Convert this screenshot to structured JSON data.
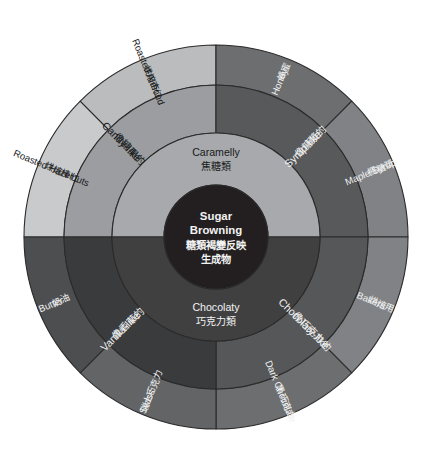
{
  "figure": {
    "background_color": "#ffffff",
    "stroke_color": "#2b2b2b"
  },
  "core": {
    "name": "core-hub",
    "en_line1": "Sugar",
    "en_line2": "Browning",
    "zh_line1": "糖類褐變反映",
    "zh_line2": "生成物",
    "color": "#231f20",
    "text_color": "#f2f3f3"
  },
  "inner_ring": [
    {
      "key": "caramelly",
      "en": "Caramelly",
      "zh": "焦糖類",
      "color": "#a7a9ac",
      "text_color": "#17191a",
      "start_angle": 180,
      "end_angle": 360
    },
    {
      "key": "chocolaty",
      "en": "Chocolaty",
      "zh": "巧克力類",
      "color": "#404041",
      "text_color": "#f2f3f3",
      "start_angle": 0,
      "end_angle": 180
    }
  ],
  "middle_ring": [
    {
      "key": "candy-like",
      "en": "Candy-like",
      "zh": "像糖果的",
      "color": "#9b9da0",
      "text_color": "#17191a",
      "start_angle": 180,
      "end_angle": 270
    },
    {
      "key": "syrup-like",
      "en": "Syrup-like",
      "zh": "像糖漿的",
      "color": "#58595b",
      "text_color": "#f2f3f3",
      "start_angle": 270,
      "end_angle": 360
    },
    {
      "key": "chocolaty-like",
      "en": "Chocolaty-like",
      "zh": "像巧克力的",
      "color": "#565758",
      "text_color": "#f2f3f3",
      "start_angle": 0,
      "end_angle": 90
    },
    {
      "key": "vanilla-like",
      "en": "Vanilla-like",
      "zh": "像香草的",
      "color": "#3a3b3d",
      "text_color": "#f2f3f3",
      "start_angle": 90,
      "end_angle": 180
    }
  ],
  "outer_ring": [
    {
      "key": "roasted-hazelnuts",
      "en": "Roasted Hazelnuts",
      "zh": "烘焙榛仁",
      "color": "#c9cacb",
      "text_color": "#17191a",
      "start_angle": 180,
      "end_angle": 225
    },
    {
      "key": "roasted-almond",
      "en": "Roasted Almond",
      "zh": "烘焙杏仁",
      "color": "#babcbd",
      "text_color": "#17191a",
      "start_angle": 225,
      "end_angle": 270
    },
    {
      "key": "honey",
      "en": "Honey",
      "zh": "蜂蜜",
      "color": "#6d6e70",
      "text_color": "#f2f3f3",
      "start_angle": 270,
      "end_angle": 315
    },
    {
      "key": "maple-syrup",
      "en": "Maple Syrup",
      "zh": "楓糖漿",
      "color": "#808285",
      "text_color": "#f2f3f3",
      "start_angle": 315,
      "end_angle": 360
    },
    {
      "key": "bakers",
      "en": "Bakers",
      "zh": "烘焙用",
      "color": "#808285",
      "text_color": "#f2f3f3",
      "start_angle": 0,
      "end_angle": 45
    },
    {
      "key": "dark-chocolate",
      "en": "Dark Chocolate",
      "zh": "黑巧克力",
      "color": "#6d6e70",
      "text_color": "#f2f3f3",
      "start_angle": 45,
      "end_angle": 90
    },
    {
      "key": "swiss",
      "en": "Swiss",
      "zh": "瑞士巧克力",
      "color": "#636466",
      "text_color": "#f2f3f3",
      "start_angle": 90,
      "end_angle": 135
    },
    {
      "key": "butter",
      "en": "Butter",
      "zh": "奶油",
      "color": "#4d4e50",
      "text_color": "#f2f3f3",
      "start_angle": 135,
      "end_angle": 180
    }
  ],
  "geometry": {
    "cx": 216,
    "cy": 237,
    "r_core": 52,
    "r_inner": 104,
    "r_middle": 152,
    "r_outer": 192
  }
}
